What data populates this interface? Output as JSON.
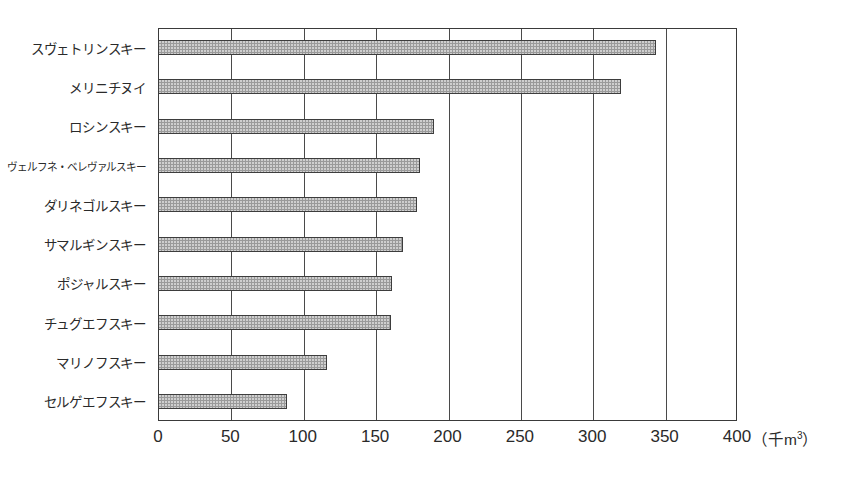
{
  "chart_data": {
    "type": "bar",
    "orientation": "horizontal",
    "title": "",
    "xlabel": "(千m³)",
    "ylabel": "",
    "xlim": [
      0,
      400
    ],
    "xticks": [
      0,
      50,
      100,
      150,
      200,
      250,
      300,
      350,
      400
    ],
    "grid": true,
    "legend": null,
    "categories": [
      "スヴェトリンスキー",
      "メリニチヌイ",
      "ロシンスキー",
      "ヴェルフネ・ベレヴァルスキー",
      "ダリネゴルスキー",
      "サマルギンスキー",
      "ポジャルスキー",
      "チュグエフスキー",
      "マリノフスキー",
      "セルゲエフスキー"
    ],
    "values": [
      344,
      320,
      191,
      181,
      179,
      169,
      162,
      161,
      117,
      89
    ],
    "unit": "千m3",
    "bar_fill": "#9a9a9a",
    "bar_border": "#3d3d3d",
    "axis_color": "#3a3a3a",
    "grid_color": "#4a4a4a",
    "background": "#ffffff"
  }
}
